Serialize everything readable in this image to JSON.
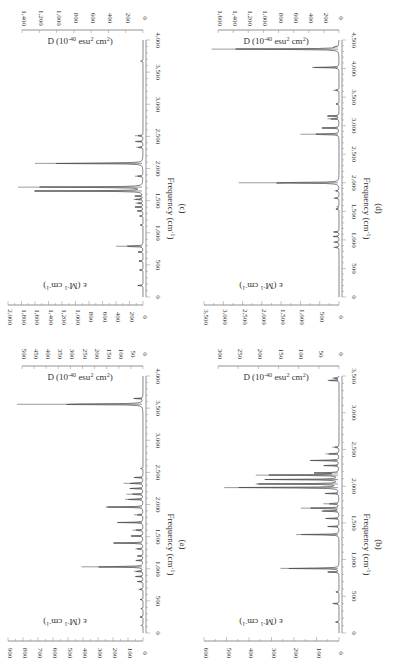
{
  "chart_data": [
    {
      "type": "line",
      "panel_label": "(c)",
      "title": "",
      "xlabel": "Frequency (cm-1)",
      "ylabel": "ε (M-1 cm-1)",
      "y2label": "D (10-40 esu2 cm2)",
      "xlim": [
        0,
        4000
      ],
      "ylim": [
        0,
        2000
      ],
      "y2lim": [
        0,
        1400
      ],
      "xticks": [
        "0",
        "500",
        "1,000",
        "1,500",
        "2,000",
        "2,500",
        "3,000",
        "3,500",
        "4,000"
      ],
      "yticks": [
        "0",
        "200",
        "400",
        "600",
        "800",
        "1,000",
        "1,200",
        "1,400",
        "1,600",
        "1,800",
        "2,000"
      ],
      "y2ticks": [
        "0",
        "200",
        "400",
        "600",
        "800",
        "1,000",
        "1,200",
        "1,400"
      ],
      "peaks": [
        {
          "x": 180,
          "y": 80
        },
        {
          "x": 420,
          "y": 50
        },
        {
          "x": 560,
          "y": 60
        },
        {
          "x": 700,
          "y": 70
        },
        {
          "x": 790,
          "y": 400
        },
        {
          "x": 1120,
          "y": 40
        },
        {
          "x": 1260,
          "y": 50
        },
        {
          "x": 1340,
          "y": 90
        },
        {
          "x": 1400,
          "y": 120
        },
        {
          "x": 1460,
          "y": 110
        },
        {
          "x": 1520,
          "y": 140
        },
        {
          "x": 1570,
          "y": 130
        },
        {
          "x": 1650,
          "y": 1600
        },
        {
          "x": 1710,
          "y": 1850
        },
        {
          "x": 1880,
          "y": 120
        },
        {
          "x": 2080,
          "y": 1600
        },
        {
          "x": 2330,
          "y": 100
        },
        {
          "x": 2420,
          "y": 110
        },
        {
          "x": 2510,
          "y": 120
        },
        {
          "x": 3670,
          "y": 40
        }
      ]
    },
    {
      "type": "line",
      "panel_label": "(a)",
      "title": "",
      "xlabel": "Frequency (cm-1)",
      "ylabel": "ε (M-1 cm-1)",
      "y2label": "D (10-40 esu2 cm2)",
      "xlim": [
        0,
        4000
      ],
      "ylim": [
        0,
        900
      ],
      "y2lim": [
        0,
        500
      ],
      "xticks": [
        "0",
        "500",
        "1,000",
        "1,500",
        "2,000",
        "2,500",
        "3,000",
        "3,500",
        "4,000"
      ],
      "yticks": [
        "0",
        "100",
        "200",
        "300",
        "400",
        "500",
        "600",
        "700",
        "800",
        "900"
      ],
      "y2ticks": [
        "0",
        "50",
        "100",
        "150",
        "200",
        "250",
        "300",
        "350",
        "400",
        "450",
        "500"
      ],
      "peaks": [
        {
          "x": 120,
          "y": 15
        },
        {
          "x": 250,
          "y": 20
        },
        {
          "x": 380,
          "y": 15
        },
        {
          "x": 520,
          "y": 20
        },
        {
          "x": 680,
          "y": 30
        },
        {
          "x": 800,
          "y": 40
        },
        {
          "x": 880,
          "y": 50
        },
        {
          "x": 960,
          "y": 60
        },
        {
          "x": 1030,
          "y": 410
        },
        {
          "x": 1130,
          "y": 50
        },
        {
          "x": 1200,
          "y": 40
        },
        {
          "x": 1310,
          "y": 50
        },
        {
          "x": 1400,
          "y": 200
        },
        {
          "x": 1510,
          "y": 80
        },
        {
          "x": 1600,
          "y": 70
        },
        {
          "x": 1720,
          "y": 170
        },
        {
          "x": 1840,
          "y": 60
        },
        {
          "x": 1960,
          "y": 250
        },
        {
          "x": 2080,
          "y": 120
        },
        {
          "x": 2160,
          "y": 110
        },
        {
          "x": 2250,
          "y": 90
        },
        {
          "x": 2330,
          "y": 130
        },
        {
          "x": 2420,
          "y": 60
        },
        {
          "x": 2560,
          "y": 15
        },
        {
          "x": 3560,
          "y": 840
        },
        {
          "x": 3650,
          "y": 60
        }
      ]
    },
    {
      "type": "line",
      "panel_label": "(d)",
      "title": "",
      "xlabel": "Frequency (cm-1)",
      "ylabel": "ε (M-1 cm-1)",
      "y2label": "D (10-40 esu2 cm2)",
      "xlim": [
        0,
        4500
      ],
      "ylim": [
        0,
        3500
      ],
      "y2lim": [
        0,
        1600
      ],
      "xticks": [
        "0",
        "500",
        "1,000",
        "1,500",
        "2,000",
        "2,500",
        "3,000",
        "3,500",
        "4,000",
        "4,500"
      ],
      "yticks": [
        "0",
        "500",
        "1,000",
        "1,500",
        "2,000",
        "2,500",
        "3,000",
        "3,500"
      ],
      "y2ticks": [
        "0",
        "200",
        "400",
        "600",
        "800",
        "1,000",
        "1,200",
        "1,400",
        "1,600"
      ],
      "peaks": [
        {
          "x": 870,
          "y": 150
        },
        {
          "x": 960,
          "y": 150
        },
        {
          "x": 1060,
          "y": 150
        },
        {
          "x": 1140,
          "y": 150
        },
        {
          "x": 1540,
          "y": 80
        },
        {
          "x": 1580,
          "y": 60
        },
        {
          "x": 1730,
          "y": 150
        },
        {
          "x": 1860,
          "y": 120
        },
        {
          "x": 2000,
          "y": 2600
        },
        {
          "x": 2850,
          "y": 1000
        },
        {
          "x": 2960,
          "y": 450
        },
        {
          "x": 3120,
          "y": 300
        },
        {
          "x": 3170,
          "y": 300
        },
        {
          "x": 3380,
          "y": 80
        },
        {
          "x": 3620,
          "y": 150
        },
        {
          "x": 4020,
          "y": 700
        },
        {
          "x": 4340,
          "y": 3300
        },
        {
          "x": 4380,
          "y": 100
        }
      ]
    },
    {
      "type": "line",
      "panel_label": "(b)",
      "title": "",
      "xlabel": "Frequency (cm-1)",
      "ylabel": "ε (M-1 cm-1)",
      "y2label": "D (10-40 esu2 cm2)",
      "xlim": [
        0,
        3500
      ],
      "ylim": [
        0,
        600
      ],
      "y2lim": [
        0,
        300
      ],
      "xticks": [
        "0",
        "500",
        "1,000",
        "1,500",
        "2,000",
        "2,500",
        "3,000",
        "3,500"
      ],
      "yticks": [
        "0",
        "100",
        "200",
        "300",
        "400",
        "500",
        "600"
      ],
      "y2ticks": [
        "0",
        "50",
        "100",
        "150",
        "200",
        "250",
        "300"
      ],
      "peaks": [
        {
          "x": 150,
          "y": 15
        },
        {
          "x": 400,
          "y": 30
        },
        {
          "x": 560,
          "y": 15
        },
        {
          "x": 830,
          "y": 50
        },
        {
          "x": 880,
          "y": 260
        },
        {
          "x": 1340,
          "y": 190
        },
        {
          "x": 1450,
          "y": 50
        },
        {
          "x": 1560,
          "y": 60
        },
        {
          "x": 1660,
          "y": 80
        },
        {
          "x": 1700,
          "y": 170
        },
        {
          "x": 1760,
          "y": 70
        },
        {
          "x": 1900,
          "y": 60
        },
        {
          "x": 1980,
          "y": 510
        },
        {
          "x": 2030,
          "y": 370
        },
        {
          "x": 2090,
          "y": 330
        },
        {
          "x": 2150,
          "y": 370
        },
        {
          "x": 2180,
          "y": 110
        },
        {
          "x": 2280,
          "y": 70
        },
        {
          "x": 2350,
          "y": 130
        },
        {
          "x": 2440,
          "y": 60
        },
        {
          "x": 2530,
          "y": 30
        },
        {
          "x": 3440,
          "y": 50
        },
        {
          "x": 3470,
          "y": 30
        }
      ]
    }
  ]
}
